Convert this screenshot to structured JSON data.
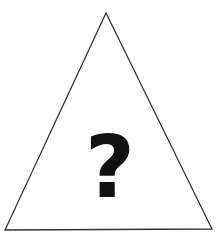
{
  "diagram": {
    "shape": "triangle",
    "triangle": {
      "apex": [
        106,
        13
      ],
      "bottom_left": [
        5,
        230
      ],
      "bottom_right": [
        212,
        229
      ],
      "stroke_color": "#333333",
      "fill_color": "#ffffff"
    },
    "symbol": {
      "text": "?",
      "color": "#111111"
    }
  }
}
